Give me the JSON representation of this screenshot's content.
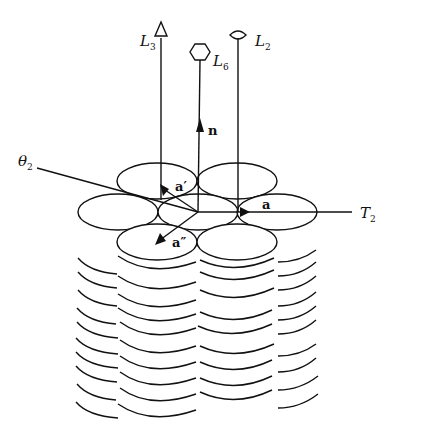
{
  "diagram": {
    "type": "stacked-disk columnar lattice with symmetry axes",
    "labels": {
      "L3": {
        "main": "L",
        "sub": "3",
        "symbol": "triangle (3-fold axis)"
      },
      "L6": {
        "main": "L",
        "sub": "6",
        "symbol": "hexagon (6-fold axis)"
      },
      "L2": {
        "main": "L",
        "sub": "2",
        "symbol": "lens/eye (2-fold axis)"
      },
      "theta2": {
        "main": "θ",
        "sub": "2"
      },
      "T2": {
        "main": "T",
        "sub": "2"
      }
    },
    "vectors": {
      "n": "n",
      "a": "a",
      "a_prime": "a′",
      "a_double_prime": "a″"
    },
    "colors": {
      "line": "#111111",
      "background": "#ffffff"
    }
  }
}
